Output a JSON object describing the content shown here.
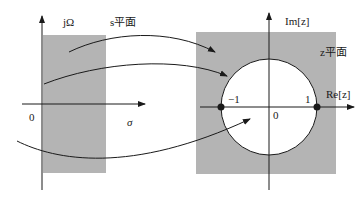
{
  "diagram": {
    "s_plane": {
      "title": "s平面",
      "vertical_axis_label": "jΩ",
      "horizontal_axis_label": "σ",
      "origin_label": "0",
      "shaded_region": "strip"
    },
    "z_plane": {
      "title": "z平面",
      "vertical_axis_label": "Im[z]",
      "horizontal_axis_label": "Re[z]",
      "origin_label": "0",
      "minus_one_label": "−1",
      "one_label": "1",
      "unit_circle": true
    },
    "mapping_arrows": 3,
    "colors": {
      "shade": "#b4b4b4",
      "line": "#1a1a1a",
      "background": "#ffffff"
    }
  }
}
